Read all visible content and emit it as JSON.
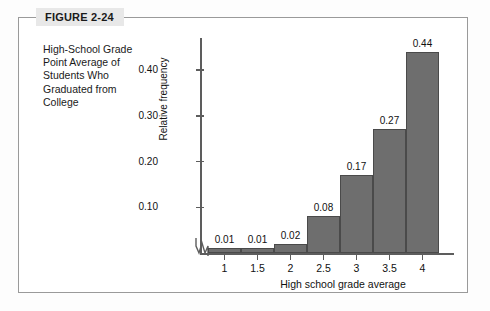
{
  "figure": {
    "badge_label": "FIGURE 2-24",
    "caption": "High-School Grade Point Average of Students Who Graduated from College"
  },
  "colors": {
    "bar_fill": "#6e6e6e",
    "bar_stroke": "#4a4a4a",
    "axis": "#5d5d5d",
    "frame": "#9a9a9a",
    "badge_bg": "#e8e8e8",
    "text": "#111111"
  },
  "chart_data": {
    "type": "bar",
    "title": "",
    "subtitle": "",
    "xlabel": "High school grade average",
    "ylabel": "Relative frequency",
    "categories": [
      "1",
      "1.5",
      "2",
      "2.5",
      "3",
      "3.5",
      "4"
    ],
    "values": [
      0.01,
      0.01,
      0.02,
      0.08,
      0.17,
      0.27,
      0.44
    ],
    "data_labels": [
      "0.01",
      "0.01",
      "0.02",
      "0.08",
      "0.17",
      "0.27",
      "0.44"
    ],
    "ytick_labels": [
      "0.10",
      "0.20",
      "0.30",
      "0.40"
    ],
    "ytick_values": [
      0.1,
      0.2,
      0.3,
      0.4
    ],
    "ylim": [
      0,
      0.47
    ],
    "grid": false,
    "legend": false,
    "axis_break": true,
    "bars_contiguous": true
  }
}
